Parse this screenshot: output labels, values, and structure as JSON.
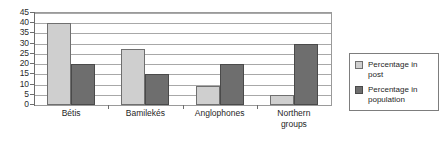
{
  "chart_data": {
    "type": "bar",
    "title": "",
    "subtitle": "",
    "xlabel": "",
    "ylabel": "",
    "ylim": [
      0,
      45
    ],
    "ytick_step": 5,
    "yticks": [
      45,
      40,
      35,
      30,
      25,
      20,
      15,
      10,
      5,
      0
    ],
    "grid": true,
    "grid_axis": "y",
    "legend_position": "right",
    "categories": [
      "Bétis",
      "Bamilekés",
      "Anglophones",
      "Northern groups"
    ],
    "series": [
      {
        "name": "Percentage in post",
        "color": "#cfcfcf",
        "values": [
          40,
          27.5,
          9.5,
          5
        ]
      },
      {
        "name": "Percentage in population",
        "color": "#6e6e6e",
        "values": [
          20,
          15,
          20,
          30
        ]
      }
    ]
  },
  "legend": {
    "entries": [
      {
        "label_line1": "Percentage in",
        "label_line2": "post"
      },
      {
        "label_line1": "Percentage in",
        "label_line2": "population"
      }
    ]
  },
  "axis": {
    "x_labels": [
      {
        "line1": "Bétis",
        "line2": ""
      },
      {
        "line1": "Bamilekés",
        "line2": ""
      },
      {
        "line1": "Anglophones",
        "line2": ""
      },
      {
        "line1": "Northern",
        "line2": "groups"
      }
    ]
  },
  "colors": {
    "series_post": "#cfcfcf",
    "series_population": "#6e6e6e",
    "gridline": "#a8a8a8",
    "axis": "#6d6d6d",
    "text": "#1f1f1f",
    "background": "#ffffff"
  }
}
